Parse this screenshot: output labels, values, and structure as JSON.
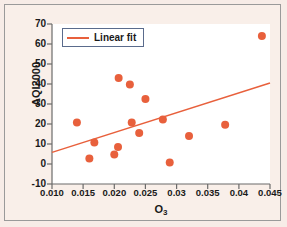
{
  "chart_data": {
    "type": "scatter",
    "title": "",
    "xlabel": "O3",
    "xlabel_base": "O",
    "xlabel_sub": "3",
    "ylabel": "AQI2000",
    "xlim": [
      0.01,
      0.045
    ],
    "ylim": [
      -10,
      70
    ],
    "xticks": [
      "0.010",
      "0.015",
      "0.020",
      "0.025",
      "0.03",
      "0.035",
      "0.04",
      "0.045"
    ],
    "xtick_values": [
      0.01,
      0.015,
      0.02,
      0.025,
      0.03,
      0.035,
      0.04,
      0.045
    ],
    "yticks": [
      "70",
      "60",
      "50",
      "40",
      "30",
      "20",
      "10",
      "0",
      "-10"
    ],
    "ytick_values": [
      70,
      60,
      50,
      40,
      30,
      20,
      10,
      0,
      -10
    ],
    "grid": false,
    "legend": {
      "position": "top-left",
      "entries": [
        {
          "label": "Linear fit",
          "type": "line",
          "color": "#e8603c"
        }
      ]
    },
    "series": [
      {
        "name": "AQI2000 vs O3",
        "type": "scatter",
        "marker": "circle",
        "color": "#e8603c",
        "points": [
          {
            "x": 0.014,
            "y": 20.7
          },
          {
            "x": 0.016,
            "y": 2.7
          },
          {
            "x": 0.0168,
            "y": 10.8
          },
          {
            "x": 0.02,
            "y": 4.7
          },
          {
            "x": 0.0206,
            "y": 8.5
          },
          {
            "x": 0.0207,
            "y": 43.0
          },
          {
            "x": 0.0225,
            "y": 39.7
          },
          {
            "x": 0.0228,
            "y": 20.8
          },
          {
            "x": 0.024,
            "y": 15.5
          },
          {
            "x": 0.025,
            "y": 32.5
          },
          {
            "x": 0.0278,
            "y": 22.3
          },
          {
            "x": 0.0289,
            "y": 0.7
          },
          {
            "x": 0.032,
            "y": 14.0
          },
          {
            "x": 0.0378,
            "y": 19.6
          },
          {
            "x": 0.0437,
            "y": 64.0
          }
        ]
      },
      {
        "name": "Linear fit",
        "type": "line",
        "color": "#e8603c",
        "endpoints": [
          {
            "x": 0.01,
            "y": 5.8
          },
          {
            "x": 0.045,
            "y": 40.5
          }
        ]
      }
    ]
  },
  "colors": {
    "accent": "#e8603c",
    "background": "#f7ece7",
    "plot_background": "#ffffff",
    "axis": "#6b6b6b",
    "frame_border": "#9a9a9a",
    "legend_border": "#5a6b8c",
    "text": "#1a1a1a"
  }
}
